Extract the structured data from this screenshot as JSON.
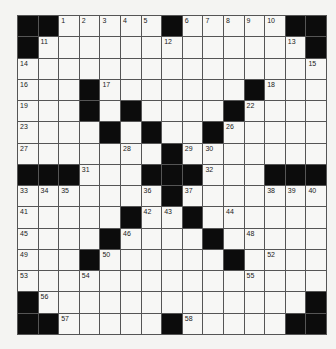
{
  "puzzle": {
    "rows": 15,
    "cols": 15,
    "layout": [
      "##.....#.....##",
      "#.............#",
      "...............",
      "...#.......#...",
      "...#.#....#....",
      "....#.#..#.....",
      ".......#.......",
      "###...###...###",
      ".......#.......",
      ".....#..#......",
      "....#....#.....",
      "...#......#....",
      "...............",
      "#.............#",
      "##.....#.....##"
    ],
    "numbers": [
      {
        "r": 0,
        "c": 2,
        "n": "1"
      },
      {
        "r": 0,
        "c": 3,
        "n": "2"
      },
      {
        "r": 0,
        "c": 4,
        "n": "3"
      },
      {
        "r": 0,
        "c": 5,
        "n": "4"
      },
      {
        "r": 0,
        "c": 6,
        "n": "5"
      },
      {
        "r": 0,
        "c": 8,
        "n": "6"
      },
      {
        "r": 0,
        "c": 9,
        "n": "7"
      },
      {
        "r": 0,
        "c": 10,
        "n": "8"
      },
      {
        "r": 0,
        "c": 11,
        "n": "9"
      },
      {
        "r": 0,
        "c": 12,
        "n": "10"
      },
      {
        "r": 1,
        "c": 1,
        "n": "11"
      },
      {
        "r": 1,
        "c": 7,
        "n": "12"
      },
      {
        "r": 1,
        "c": 13,
        "n": "13"
      },
      {
        "r": 2,
        "c": 0,
        "n": "14"
      },
      {
        "r": 2,
        "c": 14,
        "n": "15"
      },
      {
        "r": 3,
        "c": 0,
        "n": "16"
      },
      {
        "r": 3,
        "c": 4,
        "n": "17"
      },
      {
        "r": 3,
        "c": 12,
        "n": "18"
      },
      {
        "r": 4,
        "c": 0,
        "n": "19"
      },
      {
        "r": 4,
        "c": 3,
        "n": "20"
      },
      {
        "r": 4,
        "c": 5,
        "n": "21"
      },
      {
        "r": 4,
        "c": 11,
        "n": "22"
      },
      {
        "r": 5,
        "c": 0,
        "n": "23"
      },
      {
        "r": 5,
        "c": 4,
        "n": "24"
      },
      {
        "r": 5,
        "c": 6,
        "n": "25"
      },
      {
        "r": 5,
        "c": 10,
        "n": "26"
      },
      {
        "r": 6,
        "c": 0,
        "n": "27"
      },
      {
        "r": 6,
        "c": 5,
        "n": "28"
      },
      {
        "r": 6,
        "c": 8,
        "n": "29"
      },
      {
        "r": 6,
        "c": 9,
        "n": "30"
      },
      {
        "r": 7,
        "c": 3,
        "n": "31"
      },
      {
        "r": 7,
        "c": 9,
        "n": "32"
      },
      {
        "r": 8,
        "c": 0,
        "n": "33"
      },
      {
        "r": 8,
        "c": 1,
        "n": "34"
      },
      {
        "r": 8,
        "c": 2,
        "n": "35"
      },
      {
        "r": 8,
        "c": 6,
        "n": "36"
      },
      {
        "r": 8,
        "c": 8,
        "n": "37"
      },
      {
        "r": 8,
        "c": 12,
        "n": "38"
      },
      {
        "r": 8,
        "c": 13,
        "n": "39"
      },
      {
        "r": 8,
        "c": 14,
        "n": "40"
      },
      {
        "r": 9,
        "c": 0,
        "n": "41"
      },
      {
        "r": 9,
        "c": 6,
        "n": "42"
      },
      {
        "r": 9,
        "c": 7,
        "n": "43"
      },
      {
        "r": 9,
        "c": 10,
        "n": "44"
      },
      {
        "r": 10,
        "c": 0,
        "n": "45"
      },
      {
        "r": 10,
        "c": 5,
        "n": "46"
      },
      {
        "r": 10,
        "c": 9,
        "n": "47"
      },
      {
        "r": 10,
        "c": 11,
        "n": "48"
      },
      {
        "r": 11,
        "c": 0,
        "n": "49"
      },
      {
        "r": 11,
        "c": 4,
        "n": "50"
      },
      {
        "r": 11,
        "c": 10,
        "n": "51"
      },
      {
        "r": 11,
        "c": 12,
        "n": "52"
      },
      {
        "r": 12,
        "c": 0,
        "n": "53"
      },
      {
        "r": 12,
        "c": 3,
        "n": "54"
      },
      {
        "r": 12,
        "c": 11,
        "n": "55"
      },
      {
        "r": 13,
        "c": 1,
        "n": "56"
      },
      {
        "r": 14,
        "c": 2,
        "n": "57"
      },
      {
        "r": 14,
        "c": 8,
        "n": "58"
      }
    ]
  }
}
